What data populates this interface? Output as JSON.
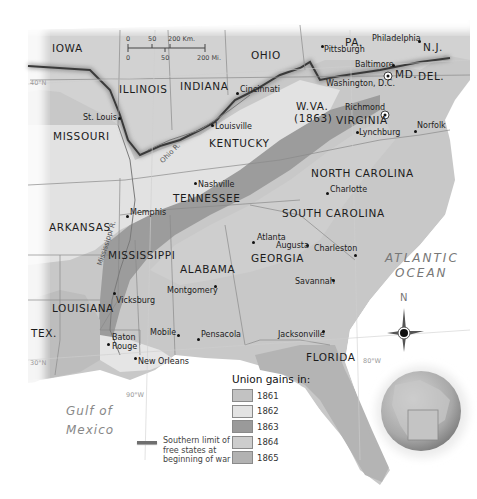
{
  "map": {
    "scale_bar": {
      "km_ticks": [
        "0",
        "50",
        "200 Km."
      ],
      "mi_ticks": [
        "0",
        "50",
        "200 Mi."
      ]
    },
    "states": [
      {
        "name": "IOWA"
      },
      {
        "name": "ILLINOIS"
      },
      {
        "name": "INDIANA"
      },
      {
        "name": "OHIO"
      },
      {
        "name": "PA."
      },
      {
        "name": "N.J."
      },
      {
        "name": "MD."
      },
      {
        "name": "DEL."
      },
      {
        "name": "W.VA."
      },
      {
        "name": "(1863)"
      },
      {
        "name": "VIRGINIA"
      },
      {
        "name": "MISSOURI"
      },
      {
        "name": "KENTUCKY"
      },
      {
        "name": "TENNESSEE"
      },
      {
        "name": "NORTH CAROLINA"
      },
      {
        "name": "SOUTH CAROLINA"
      },
      {
        "name": "ARKANSAS"
      },
      {
        "name": "MISSISSIPPI"
      },
      {
        "name": "ALABAMA"
      },
      {
        "name": "GEORGIA"
      },
      {
        "name": "LOUISIANA"
      },
      {
        "name": "TEX."
      },
      {
        "name": "FLORIDA"
      }
    ],
    "cities": [
      {
        "name": "Pittsburgh"
      },
      {
        "name": "Philadelphia"
      },
      {
        "name": "Baltimore"
      },
      {
        "name": "Washington, D.C."
      },
      {
        "name": "Cincinnati"
      },
      {
        "name": "St. Louis"
      },
      {
        "name": "Louisville"
      },
      {
        "name": "Richmond"
      },
      {
        "name": "Lynchburg"
      },
      {
        "name": "Norfolk"
      },
      {
        "name": "Nashville"
      },
      {
        "name": "Charlotte"
      },
      {
        "name": "Memphis"
      },
      {
        "name": "Atlanta"
      },
      {
        "name": "Augusta"
      },
      {
        "name": "Charleston"
      },
      {
        "name": "Savannah"
      },
      {
        "name": "Montgomery"
      },
      {
        "name": "Vicksburg"
      },
      {
        "name": "Mobile"
      },
      {
        "name": "Pensacola"
      },
      {
        "name": "Jacksonville"
      },
      {
        "name": "Baton Rouge"
      },
      {
        "name": "New Orleans"
      }
    ],
    "rivers": {
      "ohio": "Ohio R.",
      "mississippi": "Mississippi R."
    },
    "coords": {
      "lat40": "40°N",
      "lat30": "30°N",
      "lon90": "90°W",
      "lon80": "80°W"
    },
    "water": {
      "atlantic_1": "ATLANTIC",
      "atlantic_2": "OCEAN",
      "gulf_1": "Gulf of",
      "gulf_2": "Mexico"
    },
    "compass": {
      "north": "N"
    }
  },
  "legend": {
    "title": "Union gains in:",
    "items": [
      {
        "year": "1861",
        "color": "#c2c2c2"
      },
      {
        "year": "1862",
        "color": "#e3e3e3"
      },
      {
        "year": "1863",
        "color": "#9a9a9a"
      },
      {
        "year": "1864",
        "color": "#cdcdcd"
      },
      {
        "year": "1865",
        "color": "#b2b2b2"
      }
    ],
    "limit_line": "Southern limit of free states at beginning of war"
  }
}
